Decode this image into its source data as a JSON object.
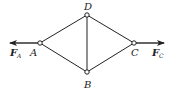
{
  "diagram": {
    "type": "truss",
    "nodes": {
      "A": {
        "label": "A",
        "x": 40,
        "y": 43
      },
      "B": {
        "label": "B",
        "x": 87,
        "y": 72
      },
      "C": {
        "label": "C",
        "x": 134,
        "y": 43
      },
      "D": {
        "label": "D",
        "x": 87,
        "y": 15
      }
    },
    "members": [
      [
        "A",
        "D"
      ],
      [
        "A",
        "B"
      ],
      [
        "D",
        "B"
      ],
      [
        "D",
        "C"
      ],
      [
        "B",
        "C"
      ]
    ],
    "forces": {
      "FA": {
        "symbol": "F",
        "subscript": "A",
        "direction": "left"
      },
      "FC": {
        "symbol": "F",
        "subscript": "C",
        "direction": "right"
      }
    },
    "colors": {
      "line": "#222222",
      "background": "#ffffff"
    }
  }
}
